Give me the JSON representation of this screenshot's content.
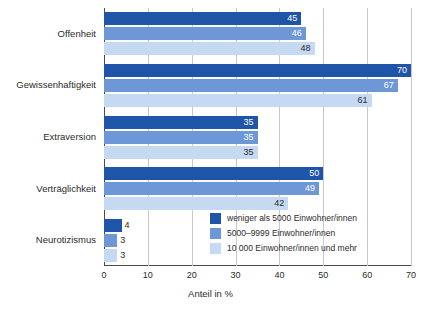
{
  "chart_data": {
    "type": "bar",
    "orientation": "horizontal",
    "title": "",
    "xlabel": "Anteil in %",
    "ylabel": "",
    "xlim": [
      0,
      70
    ],
    "xticks": [
      0,
      10,
      20,
      30,
      40,
      50,
      60,
      70
    ],
    "grid": true,
    "legend_position": "inside-bottom-right",
    "categories": [
      "Offenheit",
      "Gewissenhaftigkeit",
      "Extraversion",
      "Verträglichkeit",
      "Neurotizismus"
    ],
    "series": [
      {
        "name": "weniger als 5000 Einwohner/innen",
        "color": "#1f55a8",
        "values": [
          45,
          70,
          35,
          50,
          4
        ]
      },
      {
        "name": "5000–9999 Einwohner/innen",
        "color": "#6d97d6",
        "values": [
          46,
          67,
          35,
          49,
          3
        ]
      },
      {
        "name": "10 000 Einwohner/innen und mehr",
        "color": "#c5d9f2",
        "values": [
          48,
          61,
          35,
          42,
          3
        ]
      }
    ]
  },
  "axis": {
    "tick_labels": [
      "0",
      "10",
      "20",
      "30",
      "40",
      "50",
      "60",
      "70"
    ],
    "x_title": "Anteil in %"
  },
  "legend": {
    "items": [
      {
        "label": "weniger als 5000 Einwohner/innen",
        "color": "#1f55a8"
      },
      {
        "label": "5000–9999 Einwohner/innen",
        "color": "#6d97d6"
      },
      {
        "label": "10 000 Einwohner/innen und mehr",
        "color": "#c5d9f2"
      }
    ]
  }
}
